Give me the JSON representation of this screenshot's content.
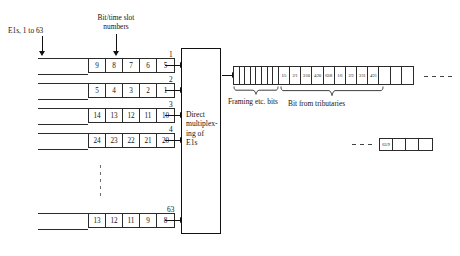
{
  "diagram": {
    "annotations": {
      "e1s_label": "E1s, 1 to 63",
      "bit_slot_label_line1": "Bit/time slot",
      "bit_slot_label_line2": "numbers",
      "framing_brace_label": "Framing etc. bits",
      "tributary_brace_label": "Bit from tributaries"
    },
    "mux_block": {
      "lines": [
        "Direct",
        "multiplex-",
        "ing of",
        "E1s"
      ],
      "full_text": "Direct multiplexing of E1s"
    },
    "e1_rows": [
      {
        "stream_number": "1",
        "cells": [
          "9",
          "8",
          "7",
          "6",
          "5"
        ]
      },
      {
        "stream_number": "2",
        "cells": [
          "5",
          "4",
          "3",
          "2",
          "1"
        ]
      },
      {
        "stream_number": "3",
        "cells": [
          "14",
          "13",
          "12",
          "11",
          "10"
        ]
      },
      {
        "stream_number": "4",
        "cells": [
          "24",
          "23",
          "22",
          "21",
          "20"
        ]
      },
      {
        "stream_number": "63",
        "cells": [
          "13",
          "12",
          "11",
          "9",
          "8"
        ]
      }
    ],
    "ellipsis": "vertical-dots",
    "output_frame": {
      "framing_cell_count": 8,
      "framing_cells": [
        "",
        "",
        "",
        "",
        "",
        "",
        "",
        ""
      ],
      "tributary_cells": [
        "1/5",
        "2/1",
        "3/10",
        "4/20",
        "63/8",
        "1/6",
        "2/2",
        "3/11",
        "4/21"
      ],
      "trailing_blank_cells": [
        "",
        "",
        ""
      ],
      "continues": true
    },
    "tail_box": {
      "cells": [
        "63/9",
        "",
        "",
        ""
      ],
      "leading_dashes": true
    },
    "colors": {
      "ink": "#141414",
      "line": "#2b2b2b",
      "block_border": "#111111",
      "background": "#ffffff",
      "dot": "#6d6d6d"
    }
  }
}
